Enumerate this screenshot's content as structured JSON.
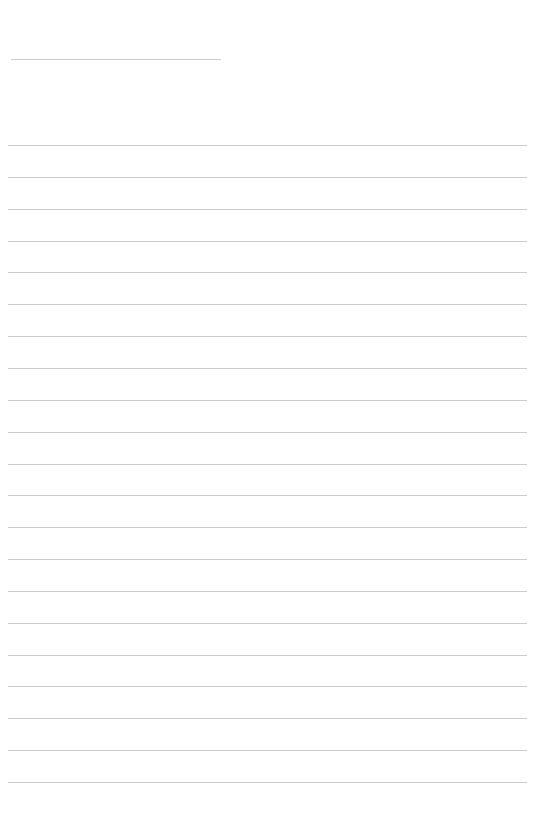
{
  "page": {
    "type": "blank-lined-sheet",
    "background": "#ffffff",
    "rule_color": "#c4c4c4"
  },
  "header_rule": {
    "x": 11,
    "y": 59,
    "width": 210
  },
  "body_rules": {
    "count": 21,
    "first_y": 145,
    "spacing": 31.85,
    "x": 8,
    "width": 519
  }
}
